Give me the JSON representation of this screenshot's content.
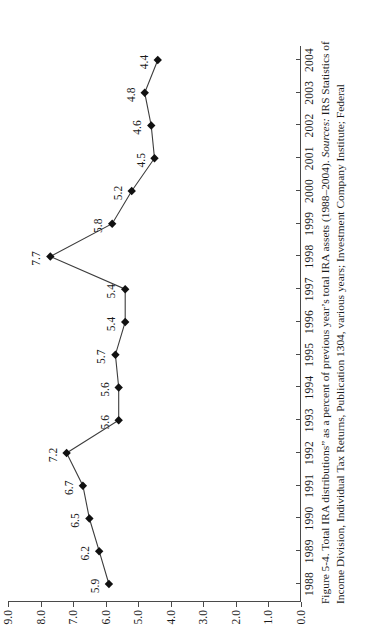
{
  "figure": {
    "caption_prefix": "Figure 5-4.",
    "caption_main": "Total IRA distributions” as a percent of previous year’s total IRA assets (1988–2004).",
    "caption_sources_label": "Sources:",
    "caption_sources_text": "IRS Statistics of Income Division, Individual Tax Returns, Publication 1304, various years; Investment Company Institute; Federal"
  },
  "chart_data": {
    "type": "line",
    "title": "",
    "xlabel": "",
    "ylabel": "",
    "grid": false,
    "legend": "none",
    "marker": "diamond",
    "line_color": "#3c3c3c",
    "marker_color": "#111111",
    "xlim": [
      1987.5,
      2004.5
    ],
    "ylim": [
      0.0,
      9.0
    ],
    "ytick_step": 1.0,
    "yticks": [
      "9.0",
      "8.0",
      "7.0",
      "6.0",
      "5.0",
      "4.0",
      "3.0",
      "2.0",
      "1.0",
      "0.0"
    ],
    "ytick_values": [
      9.0,
      8.0,
      7.0,
      6.0,
      5.0,
      4.0,
      3.0,
      2.0,
      1.0,
      0.0
    ],
    "categories": [
      "1988",
      "1989",
      "1990",
      "1991",
      "1992",
      "1993",
      "1994",
      "1995",
      "1996",
      "1997",
      "1998",
      "1999",
      "2000",
      "2001",
      "2002",
      "2003",
      "2004"
    ],
    "values": [
      5.9,
      6.2,
      6.5,
      6.7,
      7.2,
      5.6,
      5.6,
      5.7,
      5.4,
      5.4,
      7.7,
      5.8,
      5.2,
      4.5,
      4.6,
      4.8,
      4.4
    ],
    "point_labels": [
      "5.9",
      "6.2",
      "6.5",
      "6.7",
      "7.2",
      "5.6",
      "5.6",
      "5.7",
      "5.4",
      "5.4",
      "7.7",
      "5.8",
      "5.2",
      "4.5",
      "4.6",
      "4.8",
      "4.4"
    ]
  }
}
